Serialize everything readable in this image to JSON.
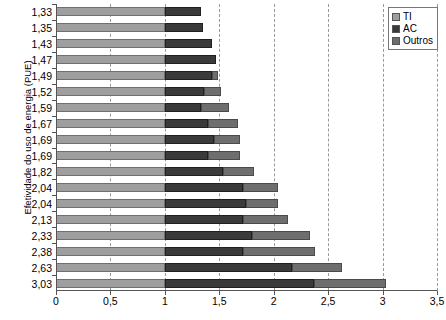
{
  "chart_data": {
    "type": "bar",
    "orientation": "horizontal",
    "stacked": true,
    "title": "",
    "xlabel": "",
    "ylabel": "Efetividade do uso de energia (PUE)",
    "xlim": [
      0,
      3.5
    ],
    "xticks": [
      "0",
      "0,5",
      "1",
      "1,5",
      "2",
      "2,5",
      "3",
      "3,5"
    ],
    "xtick_values": [
      0,
      0.5,
      1,
      1.5,
      2,
      2.5,
      3,
      3.5
    ],
    "grid": "vertical-dashed",
    "legend_position": "top-right",
    "decimal_separator": ",",
    "categories": [
      "1,33",
      "1,35",
      "1,43",
      "1,47",
      "1,49",
      "1,52",
      "1,59",
      "1,67",
      "1,69",
      "1,69",
      "1,82",
      "2,04",
      "2,04",
      "2,13",
      "2,33",
      "2,38",
      "2,63",
      "3,03"
    ],
    "totals": [
      1.33,
      1.35,
      1.43,
      1.47,
      1.49,
      1.52,
      1.59,
      1.67,
      1.69,
      1.69,
      1.82,
      2.04,
      2.04,
      2.13,
      2.33,
      2.38,
      2.63,
      3.03
    ],
    "series": [
      {
        "name": "TI",
        "color": "#9e9e9e",
        "values": [
          1.0,
          1.0,
          1.0,
          1.0,
          1.0,
          1.0,
          1.0,
          1.0,
          1.0,
          1.0,
          1.0,
          1.0,
          1.0,
          1.0,
          1.0,
          1.0,
          1.0,
          1.0
        ]
      },
      {
        "name": "AC",
        "color": "#3a3a3a",
        "values": [
          0.33,
          0.35,
          0.43,
          0.47,
          0.43,
          0.36,
          0.33,
          0.4,
          0.45,
          0.4,
          0.53,
          0.72,
          0.75,
          0.72,
          0.8,
          0.72,
          1.17,
          1.37
        ]
      },
      {
        "name": "Outros",
        "color": "#6e6e6e",
        "values": [
          0.0,
          0.0,
          0.0,
          0.0,
          0.06,
          0.16,
          0.26,
          0.27,
          0.24,
          0.29,
          0.29,
          0.32,
          0.29,
          0.41,
          0.53,
          0.66,
          0.46,
          0.66
        ]
      }
    ],
    "bars": [
      {
        "label": "1,33",
        "total": 1.33,
        "ti": 1.0,
        "ac": 0.33,
        "outros": 0.0
      },
      {
        "label": "1,35",
        "total": 1.35,
        "ti": 1.0,
        "ac": 0.35,
        "outros": 0.0
      },
      {
        "label": "1,43",
        "total": 1.43,
        "ti": 1.0,
        "ac": 0.43,
        "outros": 0.0
      },
      {
        "label": "1,47",
        "total": 1.47,
        "ti": 1.0,
        "ac": 0.47,
        "outros": 0.0
      },
      {
        "label": "1,49",
        "total": 1.49,
        "ti": 1.0,
        "ac": 0.43,
        "outros": 0.06
      },
      {
        "label": "1,52",
        "total": 1.52,
        "ti": 1.0,
        "ac": 0.36,
        "outros": 0.16
      },
      {
        "label": "1,59",
        "total": 1.59,
        "ti": 1.0,
        "ac": 0.33,
        "outros": 0.26
      },
      {
        "label": "1,67",
        "total": 1.67,
        "ti": 1.0,
        "ac": 0.4,
        "outros": 0.27
      },
      {
        "label": "1,69",
        "total": 1.69,
        "ti": 1.0,
        "ac": 0.45,
        "outros": 0.24
      },
      {
        "label": "1,69",
        "total": 1.69,
        "ti": 1.0,
        "ac": 0.4,
        "outros": 0.29
      },
      {
        "label": "1,82",
        "total": 1.82,
        "ti": 1.0,
        "ac": 0.53,
        "outros": 0.29
      },
      {
        "label": "2,04",
        "total": 2.04,
        "ti": 1.0,
        "ac": 0.72,
        "outros": 0.32
      },
      {
        "label": "2,04",
        "total": 2.04,
        "ti": 1.0,
        "ac": 0.75,
        "outros": 0.29
      },
      {
        "label": "2,13",
        "total": 2.13,
        "ti": 1.0,
        "ac": 0.72,
        "outros": 0.41
      },
      {
        "label": "2,33",
        "total": 2.33,
        "ti": 1.0,
        "ac": 0.8,
        "outros": 0.53
      },
      {
        "label": "2,38",
        "total": 2.38,
        "ti": 1.0,
        "ac": 0.72,
        "outros": 0.66
      },
      {
        "label": "2,63",
        "total": 2.63,
        "ti": 1.0,
        "ac": 1.17,
        "outros": 0.46
      },
      {
        "label": "3,03",
        "total": 3.03,
        "ti": 1.0,
        "ac": 1.37,
        "outros": 0.66
      }
    ],
    "legend": [
      {
        "label": "TI",
        "color": "#9e9e9e"
      },
      {
        "label": "AC",
        "color": "#3a3a3a"
      },
      {
        "label": "Outros",
        "color": "#6e6e6e"
      }
    ]
  }
}
